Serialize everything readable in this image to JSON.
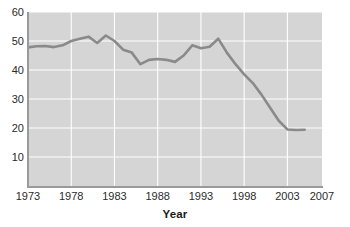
{
  "chart_data": {
    "type": "line",
    "title": "",
    "xlabel": "Year",
    "ylabel": "",
    "xlim": [
      1973,
      2007
    ],
    "ylim": [
      0,
      60
    ],
    "grid": true,
    "legend": false,
    "line_color": "#8a8a8a",
    "plot_background": "#d5d5d5",
    "gridline_color": "#ffffff",
    "axis_color": "#9a9a9a",
    "text_color": "#2b2b2b",
    "y_ticks": [
      10,
      20,
      30,
      40,
      50,
      60
    ],
    "y_tick_labels": [
      "10",
      "20",
      "30",
      "40",
      "50",
      "60"
    ],
    "x_ticks": [
      1973,
      1978,
      1983,
      1988,
      1993,
      1998,
      2003,
      2007
    ],
    "x_tick_labels": [
      "1973",
      "1978",
      "1983",
      "1988",
      "1993",
      "1998",
      "2003",
      "2007"
    ],
    "x": [
      1973,
      1974,
      1975,
      1976,
      1977,
      1978,
      1979,
      1980,
      1981,
      1982,
      1983,
      1984,
      1985,
      1986,
      1987,
      1988,
      1989,
      1990,
      1991,
      1992,
      1993,
      1994,
      1995,
      1996,
      1997,
      1998,
      1999,
      2000,
      2001,
      2002,
      2003,
      2004,
      2005
    ],
    "values": [
      47.8,
      48.2,
      48.3,
      47.9,
      48.5,
      50.0,
      50.8,
      51.5,
      49.3,
      51.9,
      50.0,
      47.0,
      46.0,
      42.0,
      43.5,
      43.8,
      43.5,
      42.8,
      45.0,
      48.5,
      47.5,
      48.0,
      50.8,
      46.0,
      42.0,
      38.5,
      35.5,
      31.5,
      27.0,
      22.5,
      19.5,
      19.3,
      19.4
    ],
    "series": [
      {
        "name": "series-1",
        "values": [
          47.8,
          48.2,
          48.3,
          47.9,
          48.5,
          50.0,
          50.8,
          51.5,
          49.3,
          51.9,
          50.0,
          47.0,
          46.0,
          42.0,
          43.5,
          43.8,
          43.5,
          42.8,
          45.0,
          48.5,
          47.5,
          48.0,
          50.8,
          46.0,
          42.0,
          38.5,
          35.5,
          31.5,
          27.0,
          22.5,
          19.5,
          19.3,
          19.4
        ]
      }
    ]
  },
  "axis_titles": {
    "x": "Year"
  },
  "clipped_header": ""
}
